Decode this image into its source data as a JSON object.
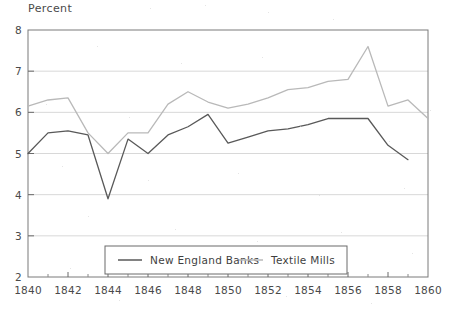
{
  "chart_data": {
    "type": "line",
    "title": "",
    "ylabel": "Percent",
    "xlabel": "",
    "xlim": [
      1840,
      1860
    ],
    "ylim": [
      2,
      8
    ],
    "grid": true,
    "legend_position": "bottom-center",
    "x_ticks": [
      "1840",
      "1842",
      "1844",
      "1846",
      "1848",
      "1850",
      "1852",
      "1854",
      "1856",
      "1858",
      "1860"
    ],
    "y_ticks": [
      "2",
      "3",
      "4",
      "5",
      "6",
      "7",
      "8"
    ],
    "x_minor_ticks": [
      1841,
      1843,
      1845,
      1847,
      1849,
      1851,
      1853,
      1855,
      1857,
      1859
    ],
    "series": [
      {
        "name": "New England Banks",
        "color": "#595959",
        "x": [
          1840,
          1841,
          1842,
          1843,
          1844,
          1845,
          1846,
          1847,
          1848,
          1849,
          1850,
          1851,
          1852,
          1853,
          1854,
          1855,
          1856,
          1857,
          1858,
          1859
        ],
        "values": [
          5.0,
          5.5,
          5.55,
          5.45,
          3.9,
          5.35,
          5.0,
          5.45,
          5.65,
          5.95,
          5.25,
          5.4,
          5.55,
          5.6,
          5.7,
          5.85,
          5.85,
          5.85,
          5.2,
          4.85
        ]
      },
      {
        "name": "Textile Mills",
        "color": "#b9b9b9",
        "x": [
          1840,
          1841,
          1842,
          1843,
          1844,
          1845,
          1846,
          1847,
          1848,
          1849,
          1850,
          1851,
          1852,
          1853,
          1854,
          1855,
          1856,
          1857,
          1858,
          1859,
          1860
        ],
        "values": [
          6.15,
          6.3,
          6.35,
          5.5,
          5.0,
          5.5,
          5.5,
          6.2,
          6.5,
          6.25,
          6.1,
          6.2,
          6.35,
          6.55,
          6.6,
          6.75,
          6.8,
          7.6,
          6.15,
          6.3,
          5.85
        ]
      }
    ]
  },
  "legend": {
    "items": [
      {
        "label": "New England Banks",
        "color": "#595959"
      },
      {
        "label": "Textile Mills",
        "color": "#b9b9b9"
      }
    ]
  }
}
